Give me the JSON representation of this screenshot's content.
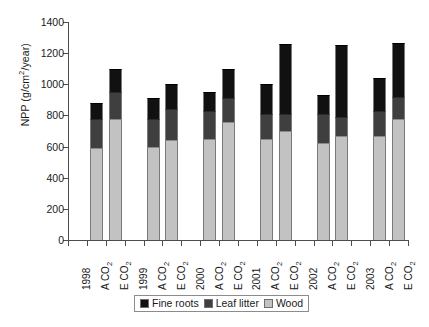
{
  "chart_data": {
    "type": "bar",
    "subtype": "stacked-vertical",
    "title": "",
    "xlabel": "",
    "ylabel": "NPP (g/cm2/year)",
    "ylabel_display": "NPP (g/cm",
    "ylabel_exponent": "2",
    "ylabel_tail": "/year)",
    "ylim": [
      0,
      1400
    ],
    "yticks": [
      0,
      200,
      400,
      600,
      800,
      1000,
      1200,
      1400
    ],
    "ytick_labels": [
      "0",
      "200",
      "400",
      "600",
      "800",
      "1000",
      "1200",
      "1400"
    ],
    "grid": false,
    "legend_position": "bottom-center",
    "categories": [
      "1998 A CO2",
      "1998 E CO2",
      "1999 A CO2",
      "1999 E CO2",
      "2000 A CO2",
      "2000 E CO2",
      "2001 A CO2",
      "2001 E CO2",
      "2002 A CO2",
      "2002 E CO2",
      "2003 A CO2",
      "2003 E CO2"
    ],
    "xtick_labels": [
      "1998",
      "A CO2",
      "E CO2",
      "1999",
      "A CO2",
      "E CO2",
      "2000",
      "A CO2",
      "E CO2",
      "2001",
      "A CO2",
      "E CO2",
      "2002",
      "A CO2",
      "E CO2",
      "2003",
      "A CO2",
      "E CO2"
    ],
    "series": [
      {
        "name": "Wood",
        "color": "#c2c2c2",
        "values": [
          590,
          780,
          600,
          640,
          650,
          755,
          650,
          700,
          620,
          670,
          670,
          780
        ]
      },
      {
        "name": "Leaf litter",
        "color": "#3f3f3f",
        "values": [
          190,
          170,
          180,
          200,
          180,
          155,
          160,
          110,
          190,
          120,
          160,
          140
        ]
      },
      {
        "name": "Fine roots",
        "color": "#111111",
        "values": [
          100,
          150,
          135,
          160,
          120,
          190,
          190,
          450,
          120,
          460,
          210,
          345
        ]
      }
    ],
    "cumulative_tops": {
      "wood": [
        590,
        780,
        600,
        640,
        650,
        755,
        650,
        700,
        620,
        670,
        670,
        780
      ],
      "wood_plus_leaf": [
        780,
        950,
        780,
        840,
        830,
        910,
        810,
        810,
        810,
        790,
        830,
        920
      ],
      "total": [
        880,
        1100,
        915,
        1000,
        950,
        1100,
        1000,
        1260,
        930,
        1250,
        1040,
        1265
      ]
    },
    "legend": [
      {
        "label": "Fine roots",
        "color": "#111111",
        "icon": "square-swatch-black"
      },
      {
        "label": "Leaf litter",
        "color": "#3f3f3f",
        "icon": "square-swatch-dark-gray"
      },
      {
        "label": "Wood",
        "color": "#c2c2c2",
        "icon": "square-swatch-light-gray"
      }
    ]
  },
  "axis": {
    "axis_color": "#4d4d4d",
    "text_color": "#1a1a1a"
  }
}
